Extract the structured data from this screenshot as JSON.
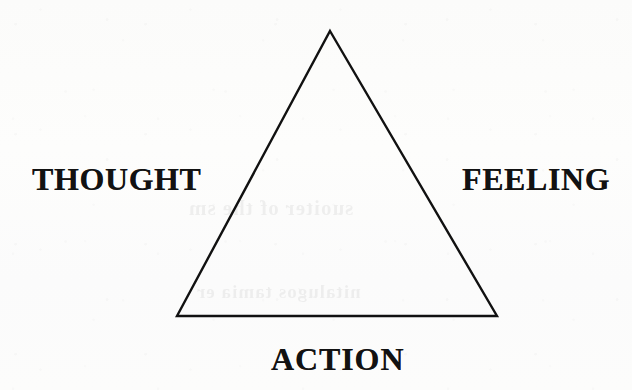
{
  "document": {
    "type": "scanned-diagram",
    "background_color": "#fcfcfc",
    "ink_color": "#121212"
  },
  "diagram": {
    "name": "thought-feeling-action-triangle",
    "shape": "triangle",
    "stroke_color": "#111111",
    "stroke_width": 2.4,
    "vertices": {
      "apex": {
        "x": 330,
        "y": 31
      },
      "bottom_left": {
        "x": 177,
        "y": 316
      },
      "bottom_right": {
        "x": 497,
        "y": 316
      }
    },
    "labels": {
      "left": "THOUGHT",
      "right": "FEELING",
      "bottom": "ACTION"
    }
  },
  "bleed_through": {
    "line_1": "suoiter of the sm",
    "line_2": "nitalugos tamia er"
  }
}
